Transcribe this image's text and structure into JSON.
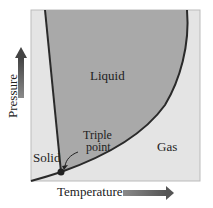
{
  "diagram": {
    "regions": {
      "liquid": "Liquid",
      "solid": "Solid",
      "gas": "Gas"
    },
    "annotation": "Triple\npoint",
    "annotation_lines": [
      "Triple",
      "point"
    ],
    "axes": {
      "x_label": "Temperature",
      "y_label": "Pressure"
    },
    "colors": {
      "liquid_fill": "#a9a9a9",
      "background_fill": "#e4e4e4",
      "curve": "#2a2a2a",
      "arrow": "#6a6a6a",
      "triple_point": "#222222"
    }
  }
}
